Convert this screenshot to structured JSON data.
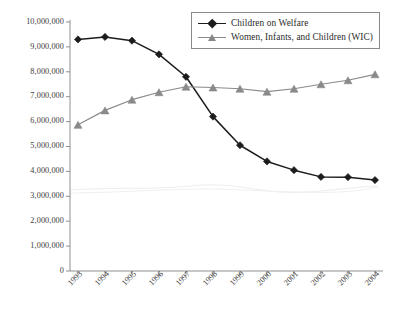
{
  "chart_data": {
    "type": "line",
    "title": "",
    "subtitle": "",
    "xlabel": "",
    "ylabel": "",
    "categories": [
      "1993",
      "1994",
      "1995",
      "1996",
      "1997",
      "1998",
      "1999",
      "2000",
      "2001",
      "2002",
      "2003",
      "2004"
    ],
    "x_tick_labels": [
      "1993",
      "1994",
      "1995",
      "1996",
      "1997",
      "1998",
      "1999",
      "2000",
      "2001",
      "2002",
      "2003",
      "2004"
    ],
    "y_tick_labels": [
      "10,000,000",
      "9,000,000",
      "8,000,000",
      "7,000,000",
      "6,000,000",
      "5,000,000",
      "4,000,000",
      "3,000,000",
      "2,000,000",
      "1,000,000",
      "0"
    ],
    "y_tick_values": [
      10000000,
      9000000,
      8000000,
      7000000,
      6000000,
      5000000,
      4000000,
      3000000,
      2000000,
      1000000,
      0
    ],
    "ylim": [
      0,
      10000000
    ],
    "grid": false,
    "legend_position": "top-right",
    "series": [
      {
        "name": "Children on Welfare",
        "color": "#1c1c1c",
        "marker": "diamond",
        "values": [
          9300000,
          9400000,
          9250000,
          8700000,
          7800000,
          6200000,
          5050000,
          4400000,
          4050000,
          3780000,
          3770000,
          3650000
        ]
      },
      {
        "name": "Women, Infants, and Children (WIC)",
        "color": "#8a8a8a",
        "marker": "triangle",
        "values": [
          5870000,
          6450000,
          6880000,
          7180000,
          7400000,
          7370000,
          7320000,
          7200000,
          7320000,
          7500000,
          7660000,
          7900000
        ]
      }
    ]
  },
  "legend": {
    "entries": [
      {
        "label": "Children on Welfare"
      },
      {
        "label": "Women, Infants, and Children (WIC)"
      }
    ]
  }
}
